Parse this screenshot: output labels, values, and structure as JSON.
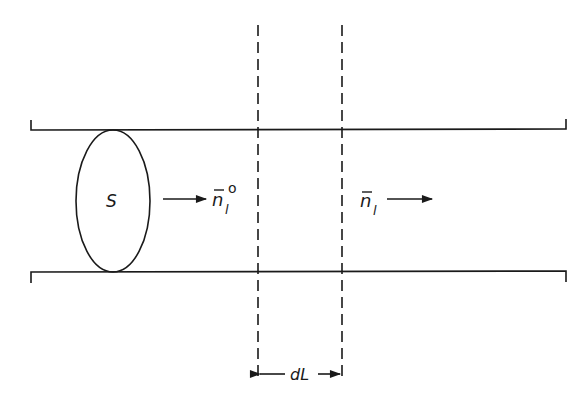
{
  "diagram": {
    "source_label": "S",
    "incoming_label": {
      "base": "n",
      "bar": true,
      "subscript": "l",
      "superscript": "o"
    },
    "outgoing_label": {
      "base": "n",
      "bar": true,
      "subscript": "l"
    },
    "slab_label": "dL",
    "colors": {
      "ink": "#1a1a1a",
      "background": "#ffffff"
    }
  }
}
